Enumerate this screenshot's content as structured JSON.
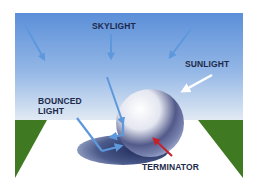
{
  "diagram": {
    "labels": {
      "skylight": "SKYLIGHT",
      "sunlight": "SUNLIGHT",
      "bounced_line1": "BOUNCED",
      "bounced_line2": "LIGHT",
      "terminator": "TERMINATOR"
    },
    "icons": {
      "skylight_arrows": "arrow-down-icon",
      "sunlight_arrow": "arrow-icon",
      "bounced_arrows": "arrow-icon",
      "terminator_arrow": "arrow-icon"
    },
    "colors": {
      "sky_top": "#5b8fd9",
      "sky_bottom": "#dfe8f2",
      "ground": "#ffffff",
      "grass": "#3f7a22",
      "arrow_blue": "#5e98dc",
      "arrow_white": "#ffffff",
      "arrow_red": "#c8202a",
      "label_text": "#1d2a4a",
      "shadow": "#3a4a7a"
    }
  }
}
